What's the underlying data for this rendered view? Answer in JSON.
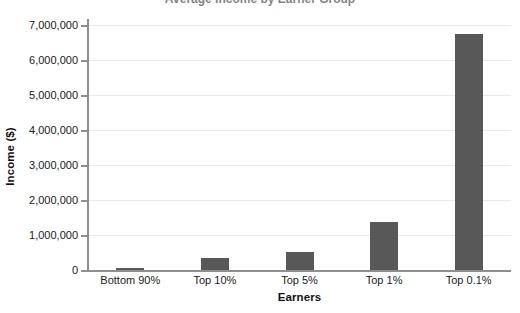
{
  "chart_data": {
    "type": "bar",
    "title": "",
    "xlabel": "Earners",
    "ylabel": "Income ($)",
    "categories": [
      "Bottom 90%",
      "Top 10%",
      "Top 5%",
      "Top 1%",
      "Top 0.1%"
    ],
    "values": [
      60000,
      340000,
      510000,
      1370000,
      6750000
    ],
    "series": [
      {
        "name": "Income",
        "values": [
          60000,
          340000,
          510000,
          1370000,
          6750000
        ]
      }
    ],
    "ylim": [
      0,
      7000000
    ],
    "ytick_values": [
      0,
      1000000,
      2000000,
      3000000,
      4000000,
      5000000,
      6000000,
      7000000
    ],
    "ytick_labels": [
      "0",
      "1,000,000",
      "2,000,000",
      "3,000,000",
      "4,000,000",
      "5,000,000",
      "6,000,000",
      "7,000,000"
    ],
    "grid": true,
    "grid_axis": "y",
    "legend": false,
    "legend_position": "none",
    "bar_color": "#585858",
    "grid_color": "#e9e9e9",
    "axis_color": "#8e8e8e",
    "text_color": "#1a1a1a",
    "background": "#ffffff"
  },
  "title_sliver": {
    "text": "Average Income by Earner Group"
  }
}
